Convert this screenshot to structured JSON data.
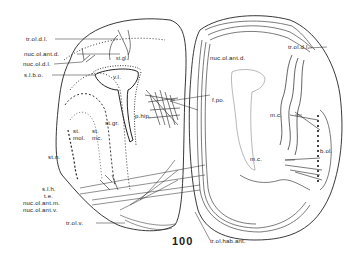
{
  "figure": {
    "number": "100",
    "labels": {
      "tr_ol_dl_left": "tr.ol.d.l.",
      "nuc_ol_ant_d_left": "nuc.ol.ant.d.",
      "nuc_ol_dl": "nuc.ol.d.l.",
      "s_l_b_o": "s.l.b.o.",
      "st_gl": "st.gl.",
      "v_l": "v.l.",
      "p_hip": "p.hip.",
      "st_gr": "st.gr.",
      "st_mol": "st.\nmol.",
      "st_mc": "st.\nmc.",
      "st_n": "st.n.",
      "s_l_h": "s.l.h.",
      "t_e": "t.e.",
      "nuc_ol_ant_m": "nuc.ol.ant.m.",
      "nuc_ol_ant_v": "nuc.ol.ant.v.",
      "tr_ol_v": "tr.ol.v.",
      "tr_ol_dl_right": "tr.ol.d.l.",
      "nuc_ol_ant_d_right": "nuc.ol.ant.d.",
      "f_po": "f.po.",
      "m_c_upper": "m.c.",
      "m_c_lower": "m.c.",
      "b_ol": "b.ol.",
      "tr_ol_hab_ant": "tr.ol.hab.ant."
    }
  }
}
